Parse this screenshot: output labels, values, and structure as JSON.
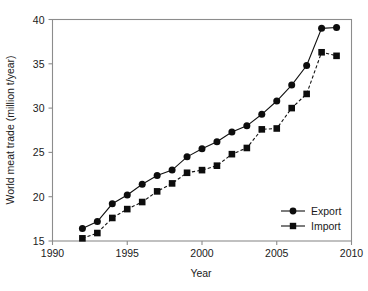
{
  "chart_data": {
    "type": "line",
    "title": "",
    "subtitle": "",
    "xlabel": "Year",
    "ylabel": "World meat trade (million t/year)",
    "xlim": [
      1990,
      2010
    ],
    "ylim": [
      15,
      40
    ],
    "xticks": [
      1990,
      1995,
      2000,
      2005,
      2010
    ],
    "yticks": [
      15,
      20,
      25,
      30,
      35,
      40
    ],
    "xtick_labels": [
      "1990",
      "1995",
      "2000",
      "2005",
      "2010"
    ],
    "ytick_labels": [
      "15",
      "20",
      "25",
      "30",
      "35",
      "40"
    ],
    "grid": false,
    "legend_position": "lower right",
    "x": [
      1992,
      1993,
      1994,
      1995,
      1996,
      1997,
      1998,
      1999,
      2000,
      2001,
      2002,
      2003,
      2004,
      2005,
      2006,
      2007,
      2008,
      2009
    ],
    "series": [
      {
        "name": "Export",
        "marker": "circle",
        "linestyle": "solid",
        "color": "#0d0d0d",
        "values": [
          16.4,
          17.2,
          19.2,
          20.2,
          21.4,
          22.4,
          23.0,
          24.5,
          25.4,
          26.2,
          27.3,
          28.0,
          29.3,
          30.8,
          32.6,
          34.8,
          39.0,
          39.1
        ]
      },
      {
        "name": "Import",
        "marker": "square",
        "linestyle": "dashed",
        "color": "#0d0d0d",
        "values": [
          15.3,
          15.9,
          17.6,
          18.6,
          19.4,
          20.6,
          21.5,
          22.7,
          23.0,
          23.5,
          24.8,
          25.5,
          27.6,
          27.7,
          30.0,
          31.6,
          36.3,
          35.9
        ]
      }
    ],
    "annotations": []
  },
  "legend": {
    "items": [
      {
        "label": "Export"
      },
      {
        "label": "Import"
      }
    ]
  },
  "colors": {
    "background": "#ffffff",
    "frame": "#8c8c8c",
    "ink": "#0d0d0d"
  }
}
